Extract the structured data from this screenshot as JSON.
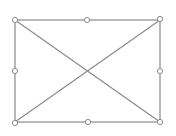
{
  "placeholder": {
    "kind": "image-placeholder",
    "frame": {
      "x1": 15,
      "y1": 20,
      "x2": 160,
      "y2": 122
    },
    "line_color": "#8a8a8a",
    "handle_stroke": "#8a8a8a",
    "handle_fill": "#ffffff",
    "handles": [
      {
        "name": "top-left",
        "x": 15,
        "y": 20
      },
      {
        "name": "top-middle",
        "x": 87,
        "y": 20
      },
      {
        "name": "top-right",
        "x": 160,
        "y": 19
      },
      {
        "name": "middle-left",
        "x": 15,
        "y": 71
      },
      {
        "name": "middle-right",
        "x": 160,
        "y": 71
      },
      {
        "name": "bottom-left",
        "x": 15,
        "y": 123
      },
      {
        "name": "bottom-middle",
        "x": 88,
        "y": 122
      },
      {
        "name": "bottom-right",
        "x": 160,
        "y": 122
      }
    ]
  }
}
